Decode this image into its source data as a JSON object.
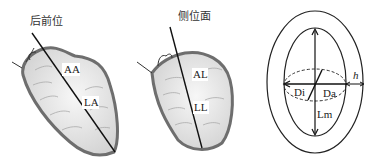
{
  "panels": [
    {
      "title": "后前位",
      "labels": {
        "upper": "AA",
        "lower": "LA"
      }
    },
    {
      "title": "侧位面",
      "labels": {
        "upper": "AL",
        "lower": "LL"
      }
    },
    {
      "title": "",
      "labels": {
        "inner_diameter": "Di",
        "outer_diameter": "Da",
        "thickness": "h",
        "length": "Lm"
      }
    }
  ],
  "colors": {
    "wall": "#6e6e6e",
    "fill": "#e6e6e6",
    "line": "#111111"
  }
}
